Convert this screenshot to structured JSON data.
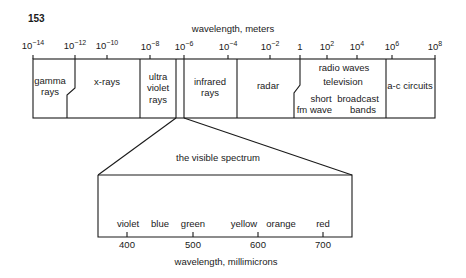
{
  "page": {
    "number": "153"
  },
  "em_spectrum": {
    "axis_title": "wavelength, meters",
    "ticks": [
      {
        "base": "10",
        "exp": "−14",
        "x": 33
      },
      {
        "base": "10",
        "exp": "−12",
        "x": 75
      },
      {
        "base": "10",
        "exp": "−10",
        "x": 107
      },
      {
        "base": "10",
        "exp": "−8",
        "x": 150
      },
      {
        "base": "10",
        "exp": "−6",
        "x": 184
      },
      {
        "base": "10",
        "exp": "−4",
        "x": 228
      },
      {
        "base": "10",
        "exp": "−2",
        "x": 270
      },
      {
        "base": "1",
        "exp": "",
        "x": 300
      },
      {
        "base": "10",
        "exp": "2",
        "x": 327
      },
      {
        "base": "10",
        "exp": "4",
        "x": 357
      },
      {
        "base": "10",
        "exp": "6",
        "x": 392
      },
      {
        "base": "10",
        "exp": "8",
        "x": 435
      }
    ],
    "bands": [
      {
        "name": "gamma",
        "lines": [
          "gamma",
          "rays"
        ]
      },
      {
        "name": "x-rays",
        "lines": [
          "x-rays"
        ]
      },
      {
        "name": "ultraviolet",
        "lines": [
          "ultra",
          "violet",
          "rays"
        ]
      },
      {
        "name": "infrared",
        "lines": [
          "infrared",
          "rays"
        ]
      },
      {
        "name": "radar",
        "lines": [
          "radar"
        ]
      },
      {
        "name": "radio",
        "lines": [
          "radio  waves",
          "television",
          "short",
          "wave",
          "broadcast",
          "bands",
          "fm"
        ]
      },
      {
        "name": "ac",
        "lines": [
          "a-c circuits"
        ]
      }
    ],
    "labels": {
      "gamma_1": "gamma",
      "gamma_2": "rays",
      "xrays": "x-rays",
      "uv_1": "ultra",
      "uv_2": "violet",
      "uv_3": "rays",
      "ir_1": "infrared",
      "ir_2": "rays",
      "radar": "radar",
      "radio_waves": "radio  waves",
      "television": "television",
      "short": "short",
      "wave": "wave",
      "broadcast": "broadcast",
      "bands": "bands",
      "fm": "fm",
      "ac": "a-c circuits"
    }
  },
  "visible_spectrum": {
    "title": "the visible spectrum",
    "axis_title": "wavelength, millimicrons",
    "colors": [
      "violet",
      "blue",
      "green",
      "yellow",
      "orange",
      "red"
    ],
    "ticks": [
      "400",
      "500",
      "600",
      "700"
    ],
    "labels": {
      "violet": "violet",
      "blue": "blue",
      "green": "green",
      "yellow": "yellow",
      "orange": "orange",
      "red": "red",
      "t400": "400",
      "t500": "500",
      "t600": "600",
      "t700": "700"
    }
  }
}
